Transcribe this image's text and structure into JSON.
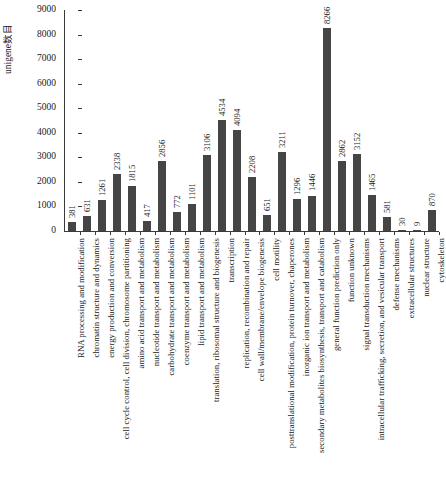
{
  "chart_data": {
    "type": "bar",
    "title": "",
    "subtitle": "",
    "xlabel": "",
    "ylabel": "unigene数目",
    "ylim": [
      0,
      9000
    ],
    "ytick_step": 1000,
    "yticks": [
      "9000",
      "8000",
      "7000",
      "6000",
      "5000",
      "4000",
      "3000",
      "2000",
      "1000",
      "0"
    ],
    "grid": false,
    "legend": "none",
    "bar_color": "#454545",
    "axis_color": "#3a3a3a",
    "value_labels_shown": true,
    "categories": [
      "RNA processing and modification",
      "chromatin structure and dynamics",
      "energy production and conversion",
      "cell cycle control, cell division, chromosome partitioning",
      "amino acid transport and metabolism",
      "nucleotide transport and metabolism",
      "carbohydrate transport and metabolism",
      "coenzyme transport and metabolism",
      "lipid transport and metabolism",
      "translation, ribosomal structure and biogenesis",
      "transcription",
      "replication, recombination and repair",
      "cell wall/membrane/envelope biogenesis",
      "cell motility",
      "posttranslational modification, protein turnover, chaperones",
      "inorganic ion transport and metabolism",
      "secondary metabolites biosynthesis, transport and catabolism",
      "general function prediction only",
      "function unknown",
      "signal transduction mechanisms",
      "intracellular trafficking, secretion, and vesicular transport",
      "defense mechanisms",
      "extracellular structures",
      "nuclear structure",
      "cytoskeleton"
    ],
    "values": [
      381,
      631,
      1261,
      2338,
      1815,
      417,
      2856,
      772,
      1101,
      3106,
      4534,
      4094,
      2208,
      651,
      3211,
      1296,
      1446,
      8266,
      2862,
      3152,
      1465,
      581,
      30,
      9,
      870
    ]
  }
}
